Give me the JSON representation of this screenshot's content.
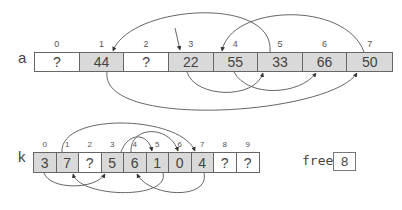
{
  "array_a": {
    "label": "a",
    "cells": [
      {
        "index": "0",
        "value": "?",
        "filled": false
      },
      {
        "index": "1",
        "value": "44",
        "filled": true
      },
      {
        "index": "2",
        "value": "?",
        "filled": false
      },
      {
        "index": "3",
        "value": "22",
        "filled": true
      },
      {
        "index": "4",
        "value": "55",
        "filled": true
      },
      {
        "index": "5",
        "value": "33",
        "filled": true
      },
      {
        "index": "6",
        "value": "66",
        "filled": true
      },
      {
        "index": "7",
        "value": "50",
        "filled": true
      }
    ],
    "links_order": [
      "3",
      "5",
      "1",
      "7",
      "4",
      "6"
    ]
  },
  "array_k": {
    "label": "k",
    "cells": [
      {
        "index": "0",
        "value": "3",
        "filled": true
      },
      {
        "index": "1",
        "value": "7",
        "filled": true
      },
      {
        "index": "2",
        "value": "?",
        "filled": false
      },
      {
        "index": "3",
        "value": "5",
        "filled": true
      },
      {
        "index": "4",
        "value": "6",
        "filled": true
      },
      {
        "index": "5",
        "value": "1",
        "filled": true
      },
      {
        "index": "6",
        "value": "0",
        "filled": true
      },
      {
        "index": "7",
        "value": "4",
        "filled": true
      },
      {
        "index": "8",
        "value": "?",
        "filled": false
      },
      {
        "index": "9",
        "value": "?",
        "filled": false
      }
    ]
  },
  "free": {
    "label": "free",
    "value": "8"
  },
  "colors": {
    "filled_cell": "#d9d9d9",
    "empty_cell": "#ffffff",
    "border": "#666666",
    "arrow": "#333333"
  }
}
